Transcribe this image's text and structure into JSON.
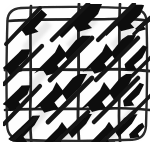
{
  "artwork": {
    "title": "Zentangle Tile",
    "pattern_name": "diagonal-chevron-grid",
    "medium": "ink on paper",
    "style": "hand-drawn",
    "canvas": {
      "width": 153,
      "height": 145,
      "background_color": "#fefefe",
      "corner_radius": 14
    },
    "ink_color": "#151515",
    "paper_color": "#ffffff",
    "shadow_color": "#b9b9b9"
  },
  "tile_border": {
    "name": "rounded-square-border",
    "stroke_color": "#2a2a2a",
    "stroke_width": 2.4,
    "inset": 6,
    "corner_radius": 13
  },
  "grid": {
    "name": "hand-drawn-grid",
    "rows": 3,
    "columns": 3,
    "line_color": "#222222",
    "line_width": 2.6,
    "horizontal_lines_y": [
      20,
      70,
      108
    ],
    "vertical_lines_x": [
      30,
      78,
      118
    ],
    "wobble": "hand-drawn"
  },
  "motifs": {
    "name": "chevron-stroke",
    "description": "thick black diagonal stroke rising left-to-right with zigzag barb",
    "count": 14,
    "fill_color": "#111111",
    "direction": "lower-left-to-upper-right",
    "cells": [
      {
        "id": "cell-r0-c0",
        "x": 14,
        "y": 16,
        "scale": 0.92,
        "rotate": -2
      },
      {
        "id": "cell-r0-c1",
        "x": 60,
        "y": 12,
        "scale": 1.0,
        "rotate": 0
      },
      {
        "id": "cell-r0-c2",
        "x": 104,
        "y": 12,
        "scale": 0.95,
        "rotate": 1
      },
      {
        "id": "cell-r0-c3",
        "x": 136,
        "y": 14,
        "scale": 0.7,
        "rotate": 2
      },
      {
        "id": "cell-r1-c0",
        "x": 4,
        "y": 54,
        "scale": 0.85,
        "rotate": -1
      },
      {
        "id": "cell-r1-c1",
        "x": 42,
        "y": 46,
        "scale": 1.05,
        "rotate": 0
      },
      {
        "id": "cell-r1-c2",
        "x": 88,
        "y": 46,
        "scale": 1.0,
        "rotate": -1
      },
      {
        "id": "cell-r1-c3",
        "x": 130,
        "y": 48,
        "scale": 0.75,
        "rotate": 3
      },
      {
        "id": "cell-r2-c0",
        "x": 4,
        "y": 90,
        "scale": 0.85,
        "rotate": -2
      },
      {
        "id": "cell-r2-c1",
        "x": 40,
        "y": 84,
        "scale": 1.0,
        "rotate": 0
      },
      {
        "id": "cell-r2-c2",
        "x": 86,
        "y": 84,
        "scale": 1.0,
        "rotate": 0
      },
      {
        "id": "cell-r2-c3",
        "x": 128,
        "y": 86,
        "scale": 0.7,
        "rotate": 2
      },
      {
        "id": "cell-r3-c0",
        "x": 10,
        "y": 120,
        "scale": 0.95,
        "rotate": -1
      },
      {
        "id": "cell-r3-c1",
        "x": 52,
        "y": 120,
        "scale": 1.0,
        "rotate": 0
      },
      {
        "id": "cell-r3-c2",
        "x": 96,
        "y": 120,
        "scale": 0.95,
        "rotate": 0
      },
      {
        "id": "cell-r3-c3",
        "x": 132,
        "y": 122,
        "scale": 0.6,
        "rotate": 4
      }
    ]
  },
  "accessibility": {
    "alt_text": "Hand-drawn black ink tile showing a wobbly square grid filled with thick diagonal chevron strokes"
  }
}
